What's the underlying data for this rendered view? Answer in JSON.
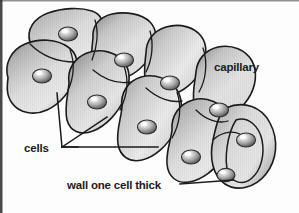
{
  "figure": {
    "background_color": "#fdfdfd",
    "outline_color": "#1b1b1b",
    "edge_border_color": "#2a2a2a"
  },
  "labels": {
    "capillary": "capillary",
    "cells": "cells",
    "wall": "wall one cell thick"
  },
  "diagram_data": {
    "type": "illustration",
    "subject": "blood capillary",
    "description": "Cut-away perspective drawing of a capillary tube built from a single layer of endothelial cells, each containing one nucleus.",
    "cell_count_visible": 9,
    "nuclei_count_visible": 9,
    "wall_thickness_cells": 1,
    "orientation": "tube runs diagonally from upper-left to lower-right",
    "shading": {
      "cell_light": "#ebebeb",
      "cell_mid": "#c2c2c2",
      "cell_dark": "#8d8d8d",
      "nucleus_light": "#f2f2f2",
      "nucleus_dark": "#5a5a5a"
    },
    "leader_lines": [
      {
        "label": "cells",
        "targets": 3
      },
      {
        "label": "wall one cell thick",
        "targets": 1
      }
    ],
    "nuclei_positions": [
      {
        "x": 68,
        "y": 34
      },
      {
        "x": 42,
        "y": 76
      },
      {
        "x": 124,
        "y": 60
      },
      {
        "x": 97,
        "y": 102
      },
      {
        "x": 170,
        "y": 83
      },
      {
        "x": 147,
        "y": 127
      },
      {
        "x": 219,
        "y": 110
      },
      {
        "x": 191,
        "y": 157
      },
      {
        "x": 246,
        "y": 140
      },
      {
        "x": 225,
        "y": 175
      }
    ]
  }
}
